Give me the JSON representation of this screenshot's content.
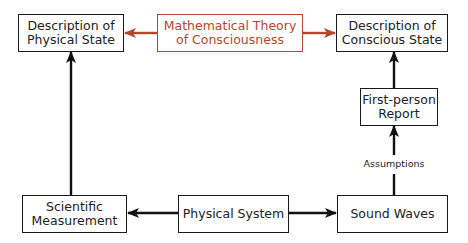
{
  "diagram": {
    "nodes": {
      "desc_physical": {
        "label": "Description of\nPhysical State"
      },
      "math_theory": {
        "label": "Mathematical Theory\nof Consciousness"
      },
      "desc_conscious": {
        "label": "Description of\nConscious State"
      },
      "first_person": {
        "label": "First-person\nReport"
      },
      "sci_measurement": {
        "label": "Scientific\nMeasurement"
      },
      "physical_system": {
        "label": "Physical System"
      },
      "sound_waves": {
        "label": "Sound Waves"
      }
    },
    "edge_labels": {
      "assumptions": "Assumptions"
    },
    "edges": [
      {
        "from": "math_theory",
        "to": "desc_physical",
        "color": "#b5452f"
      },
      {
        "from": "math_theory",
        "to": "desc_conscious",
        "color": "#b5452f"
      },
      {
        "from": "sci_measurement",
        "to": "desc_physical",
        "color": "#111111"
      },
      {
        "from": "physical_system",
        "to": "sci_measurement",
        "color": "#111111"
      },
      {
        "from": "physical_system",
        "to": "sound_waves",
        "color": "#111111"
      },
      {
        "from": "sound_waves",
        "to": "first_person",
        "color": "#111111",
        "label": "Assumptions"
      },
      {
        "from": "first_person",
        "to": "desc_conscious",
        "color": "#111111"
      }
    ],
    "colors": {
      "accent": "#b5452f",
      "line": "#111111"
    }
  }
}
